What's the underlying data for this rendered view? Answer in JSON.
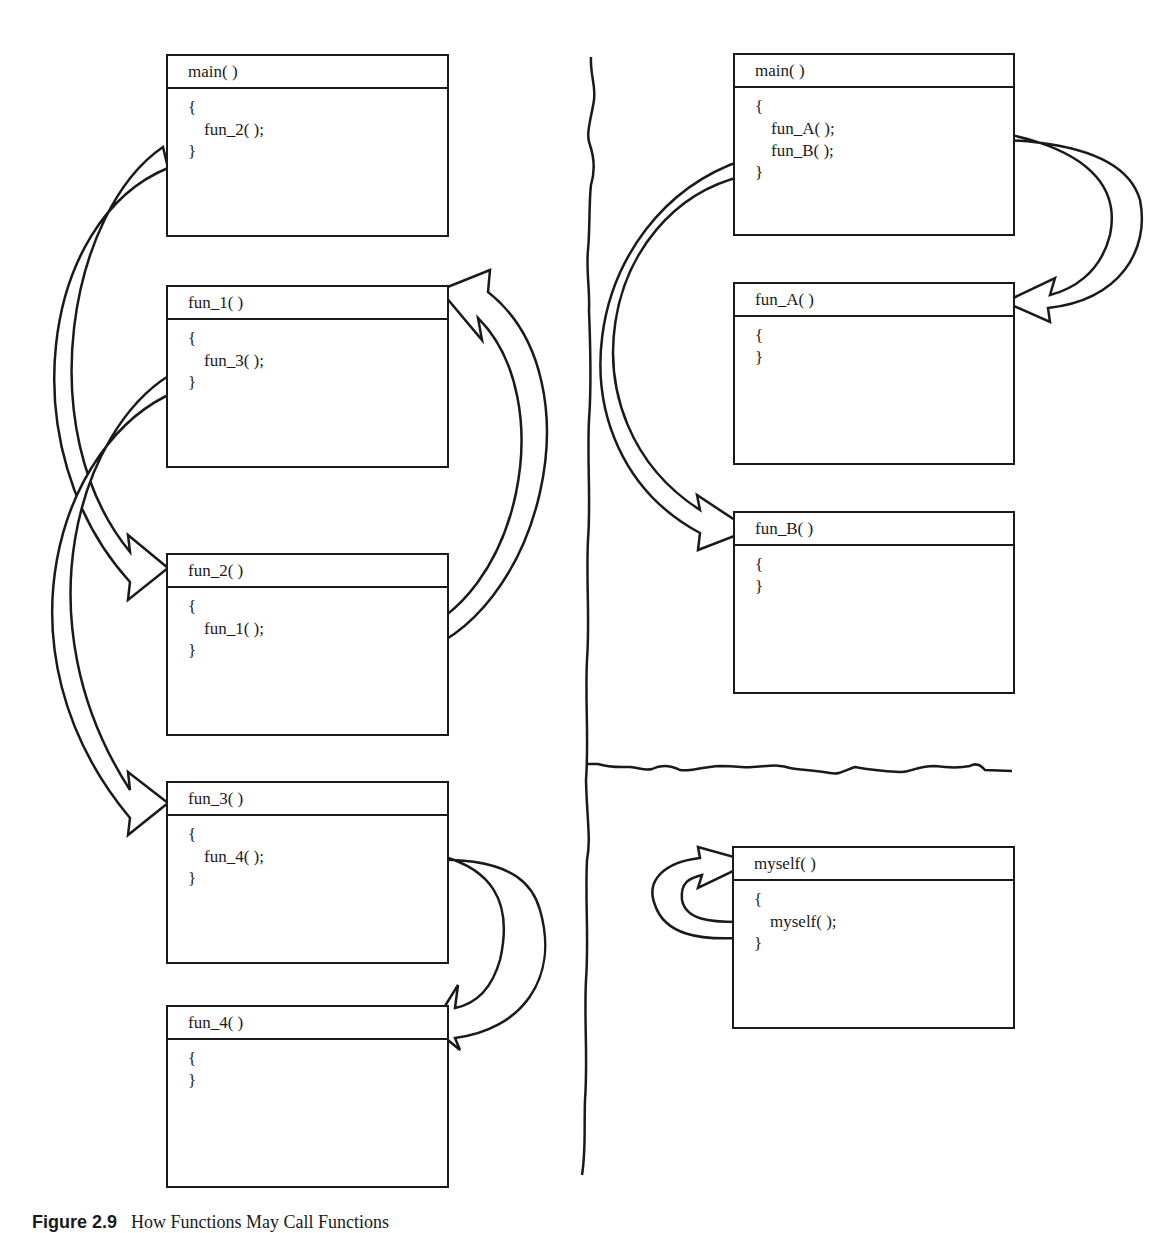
{
  "left_panel": {
    "boxes": [
      {
        "title": "main( )",
        "open": "{",
        "calls": [
          "fun_2( );"
        ],
        "close": "}"
      },
      {
        "title": "fun_1( )",
        "open": "{",
        "calls": [
          "fun_3( );"
        ],
        "close": "}"
      },
      {
        "title": "fun_2( )",
        "open": "{",
        "calls": [
          "fun_1( );"
        ],
        "close": "}"
      },
      {
        "title": "fun_3( )",
        "open": "{",
        "calls": [
          "fun_4( );"
        ],
        "close": "}"
      },
      {
        "title": "fun_4( )",
        "open": "{",
        "calls": [],
        "close": "}"
      }
    ],
    "arrows": [
      {
        "from": "main( )",
        "to": "fun_2( )"
      },
      {
        "from": "fun_2( )",
        "to": "fun_1( )"
      },
      {
        "from": "fun_1( )",
        "to": "fun_3( )"
      },
      {
        "from": "fun_3( )",
        "to": "fun_4( )"
      }
    ]
  },
  "right_top_panel": {
    "boxes": [
      {
        "title": "main( )",
        "open": "{",
        "calls": [
          "fun_A( );",
          "fun_B( );"
        ],
        "close": "}"
      },
      {
        "title": "fun_A( )",
        "open": "{",
        "calls": [],
        "close": "}"
      },
      {
        "title": "fun_B( )",
        "open": "{",
        "calls": [],
        "close": "}"
      }
    ],
    "arrows": [
      {
        "from": "main( )",
        "to": "fun_A( )"
      },
      {
        "from": "main( )",
        "to": "fun_B( )"
      }
    ]
  },
  "right_bottom_panel": {
    "boxes": [
      {
        "title": "myself( )",
        "open": "{",
        "calls": [
          "myself( );"
        ],
        "close": "}"
      }
    ],
    "arrows": [
      {
        "from": "myself( )",
        "to": "myself( )"
      }
    ]
  },
  "caption": {
    "label": "Figure 2.9",
    "text": "How Functions May Call Functions"
  }
}
